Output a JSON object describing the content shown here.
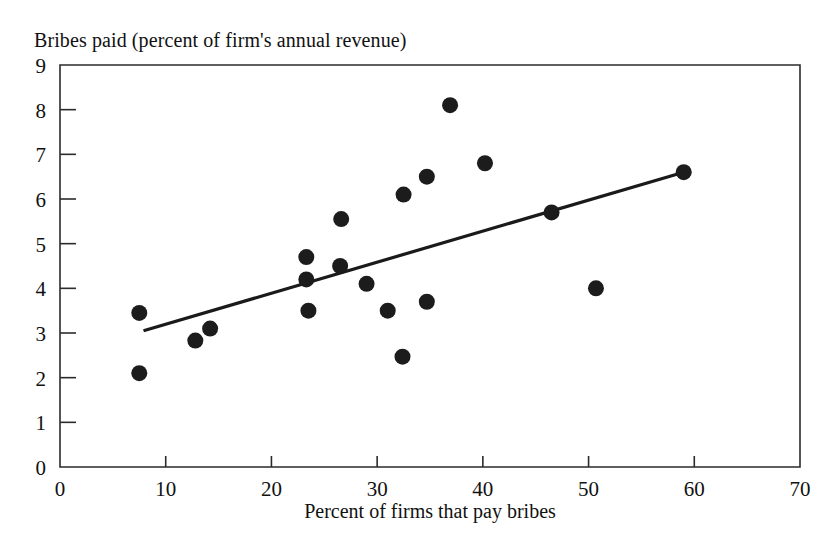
{
  "chart_data": {
    "type": "scatter",
    "title": "",
    "top_label": "Bribes paid (percent of firm's annual revenue)",
    "xlabel": "Percent of firms that pay bribes",
    "ylabel": "Bribes paid (percent of firm's annual revenue)",
    "xlim": [
      0,
      70
    ],
    "ylim": [
      0,
      9
    ],
    "xticks": [
      0,
      10,
      20,
      30,
      40,
      50,
      60,
      70
    ],
    "yticks": [
      0,
      1,
      2,
      3,
      4,
      5,
      6,
      7,
      8,
      9
    ],
    "xtick_labels": [
      "0",
      "10",
      "20",
      "30",
      "40",
      "50",
      "60",
      "70"
    ],
    "ytick_labels": [
      "0",
      "1",
      "2",
      "3",
      "4",
      "5",
      "6",
      "7",
      "8",
      "9"
    ],
    "grid": false,
    "legend": null,
    "marker": "filled-circle",
    "marker_color": "#1c1c1c",
    "marker_radius_px": 8,
    "points": [
      {
        "x": 7.5,
        "y": 3.45
      },
      {
        "x": 7.5,
        "y": 2.1
      },
      {
        "x": 12.8,
        "y": 2.83
      },
      {
        "x": 14.2,
        "y": 3.1
      },
      {
        "x": 23.3,
        "y": 4.7
      },
      {
        "x": 23.3,
        "y": 4.2
      },
      {
        "x": 23.5,
        "y": 3.5
      },
      {
        "x": 26.5,
        "y": 4.5
      },
      {
        "x": 26.6,
        "y": 5.55
      },
      {
        "x": 29.0,
        "y": 4.1
      },
      {
        "x": 31.0,
        "y": 3.5
      },
      {
        "x": 32.4,
        "y": 2.47
      },
      {
        "x": 32.5,
        "y": 6.1
      },
      {
        "x": 34.7,
        "y": 6.5
      },
      {
        "x": 34.7,
        "y": 3.7
      },
      {
        "x": 36.9,
        "y": 8.1
      },
      {
        "x": 40.2,
        "y": 6.8
      },
      {
        "x": 46.5,
        "y": 5.7
      },
      {
        "x": 50.7,
        "y": 4.0
      },
      {
        "x": 59.0,
        "y": 6.6
      }
    ],
    "fit_line": {
      "name": "linear trend",
      "x_start": 7.9,
      "y_start": 3.05,
      "x_end": 59.0,
      "y_end": 6.6,
      "color": "#1a1a1a"
    }
  },
  "colors": {
    "background": "#ffffff",
    "ink": "#111111",
    "frame": "#2b2b2b",
    "marker": "#1c1c1c",
    "trend": "#1a1a1a"
  }
}
